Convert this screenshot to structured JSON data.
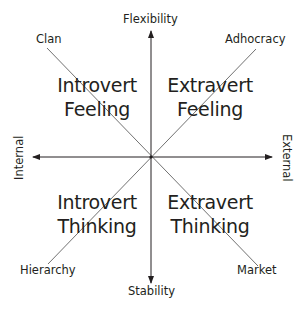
{
  "diagram": {
    "type": "competing-values-framework",
    "axes": {
      "top": "Flexibility",
      "bottom": "Stability",
      "left": "Internal",
      "right": "External"
    },
    "corners": {
      "top_left": "Clan",
      "top_right": "Adhocracy",
      "bottom_left": "Hierarchy",
      "bottom_right": "Market"
    },
    "quadrants": {
      "top_left": {
        "line1": "Introvert",
        "line2": "Feeling"
      },
      "top_right": {
        "line1": "Extravert",
        "line2": "Feeling"
      },
      "bottom_left": {
        "line1": "Introvert",
        "line2": "Thinking"
      },
      "bottom_right": {
        "line1": "Extravert",
        "line2": "Thinking"
      }
    },
    "colors": {
      "text": "#231f20",
      "axis": "#231f20",
      "diagonal": "#4d4d4d",
      "background": "#ffffff"
    }
  }
}
